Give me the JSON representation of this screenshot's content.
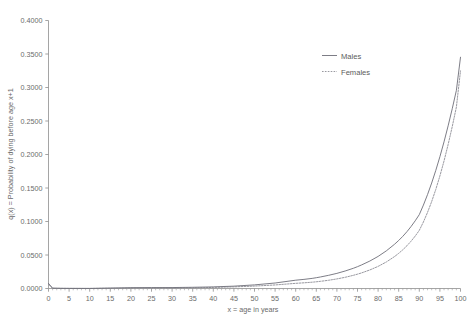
{
  "chart_data": {
    "type": "line",
    "title": "",
    "xlabel": "x = age in years",
    "ylabel": "q(x) = Probability of dying before age x+1",
    "xlim": [
      0,
      100
    ],
    "ylim": [
      0.0,
      0.4
    ],
    "grid": false,
    "legend_position": "top-right",
    "xticks": [
      0,
      5,
      10,
      15,
      20,
      25,
      30,
      35,
      40,
      45,
      50,
      55,
      60,
      65,
      70,
      75,
      80,
      85,
      90,
      95,
      100
    ],
    "xtick_labels": [
      "0",
      "5",
      "10",
      "15",
      "20",
      "25",
      "30",
      "35",
      "40",
      "45",
      "50",
      "55",
      "60",
      "65",
      "70",
      "75",
      "80",
      "85",
      "90",
      "95",
      "100"
    ],
    "xminor_step": 1,
    "yticks": [
      0.0,
      0.05,
      0.1,
      0.15,
      0.2,
      0.25,
      0.3,
      0.35,
      0.4
    ],
    "ytick_labels": [
      "0.0000",
      "0.0500",
      "0.1000",
      "0.1500",
      "0.2000",
      "0.2500",
      "0.3000",
      "0.3500",
      "0.4000"
    ],
    "x": [
      0,
      1,
      2,
      3,
      4,
      5,
      10,
      15,
      20,
      25,
      30,
      35,
      40,
      45,
      50,
      55,
      60,
      62,
      64,
      65,
      66,
      68,
      70,
      72,
      74,
      75,
      76,
      78,
      80,
      82,
      84,
      85,
      86,
      87,
      88,
      89,
      90,
      91,
      92,
      93,
      94,
      95,
      96,
      97,
      98,
      99,
      100
    ],
    "series": [
      {
        "name": "Males",
        "style": "solid",
        "color": "#6e6e78",
        "values": [
          0.0076,
          0.0005,
          0.0004,
          0.0003,
          0.0002,
          0.0002,
          0.0001,
          0.0007,
          0.0013,
          0.0014,
          0.0014,
          0.0018,
          0.0024,
          0.0035,
          0.0054,
          0.0082,
          0.0124,
          0.0136,
          0.0151,
          0.0161,
          0.0172,
          0.0197,
          0.0226,
          0.0261,
          0.0302,
          0.0326,
          0.0352,
          0.041,
          0.0479,
          0.0562,
          0.0661,
          0.0717,
          0.0779,
          0.0848,
          0.0925,
          0.101,
          0.1103,
          0.1245,
          0.1402,
          0.1574,
          0.1762,
          0.1967,
          0.2189,
          0.2428,
          0.2684,
          0.2957,
          0.3452
        ]
      },
      {
        "name": "Females",
        "style": "dashed",
        "color": "#8d8d95",
        "values": [
          0.0062,
          0.0004,
          0.0003,
          0.0002,
          0.0002,
          0.0001,
          0.0001,
          0.0003,
          0.0004,
          0.0005,
          0.0006,
          0.001,
          0.0016,
          0.0024,
          0.0036,
          0.0053,
          0.0077,
          0.0085,
          0.0094,
          0.01,
          0.0107,
          0.0123,
          0.0143,
          0.0167,
          0.0197,
          0.0214,
          0.0233,
          0.0277,
          0.033,
          0.0396,
          0.0477,
          0.0525,
          0.0578,
          0.0638,
          0.0706,
          0.0782,
          0.0868,
          0.0993,
          0.1136,
          0.1297,
          0.1478,
          0.168,
          0.1903,
          0.2149,
          0.2417,
          0.2708,
          0.3248
        ]
      }
    ]
  },
  "legend": {
    "items": [
      {
        "label": "Males"
      },
      {
        "label": "Females"
      }
    ]
  },
  "colors": {
    "background": "#ffffff",
    "axis": "#8e8e8e",
    "text": "#6a6a6a",
    "males": "#6e6e78",
    "females": "#8d8d95"
  }
}
